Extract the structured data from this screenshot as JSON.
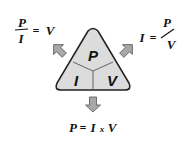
{
  "diagram": {
    "type": "formula-triangle",
    "segments": {
      "top": "P",
      "bottom_left": "I",
      "bottom_right": "V"
    },
    "formulas": {
      "left": {
        "numerator": "P",
        "denominator": "I",
        "equals": "=",
        "result": "V"
      },
      "right": {
        "lhs": "I",
        "equals": "=",
        "numerator": "P",
        "denominator": "V"
      },
      "bottom": {
        "lhs": "P",
        "equals": "=",
        "a": "I",
        "times": "x",
        "b": "V"
      }
    },
    "colors": {
      "triangle_fill": "#dcdcdc",
      "triangle_stroke": "#222222",
      "arrow_fill": "#a8a8a8",
      "arrow_stroke": "#555555",
      "text": "#111111"
    },
    "icons": {
      "left_arrow": "arrow-up-left-icon",
      "right_arrow": "arrow-up-right-icon",
      "down_arrow": "arrow-down-icon"
    }
  }
}
